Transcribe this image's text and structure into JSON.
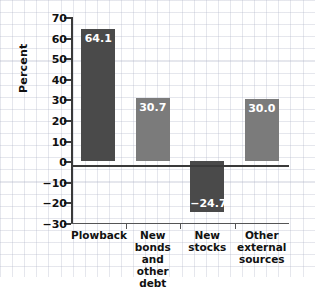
{
  "chart_data": {
    "type": "bar",
    "title": "",
    "subtitle": "",
    "xlabel": "",
    "ylabel": "Percent",
    "ylim": [
      -30,
      70
    ],
    "ytick_values": [
      70,
      60,
      50,
      40,
      30,
      20,
      10,
      0,
      -10,
      -20,
      -30
    ],
    "ytick_labels": [
      "70",
      "60",
      "50",
      "40",
      "30",
      "20",
      "10",
      "0",
      "−10",
      "−20",
      "−30"
    ],
    "grid": true,
    "legend": "none",
    "categories": [
      "Plowback",
      "New bonds\nand\nother debt",
      "New\nstocks",
      "Other\nexternal\nsources"
    ],
    "values": [
      64.1,
      30.7,
      -24.7,
      30.0
    ],
    "data_labels": [
      "64.1",
      "30.7",
      "−24.7",
      "30.0"
    ],
    "bar_colors": [
      "#4a4a4a",
      "#7b7b7b",
      "#4a4a4a",
      "#7b7b7b"
    ],
    "label_color": "#ffffff",
    "axis_color": "#3a3a3a",
    "grid_color": "#aaafc3",
    "background": "#ffffff"
  },
  "axis": {
    "y_title": "Percent"
  }
}
